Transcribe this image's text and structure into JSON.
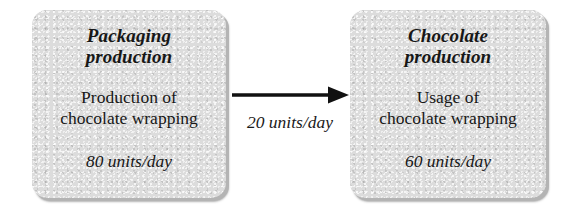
{
  "diagram": {
    "type": "process-flow",
    "title": "",
    "background_color": "#ffffff",
    "node_fill_color": "#dcdcdc",
    "node_shadow_color": "#b4b4b4",
    "connector_color": "#111111",
    "nodes": [
      {
        "id": "packaging-production",
        "title": "Packaging\nproduction",
        "body": "Production of\nchocolate wrapping",
        "rate": "80 units/day"
      },
      {
        "id": "chocolate-production",
        "title": "Chocolate\nproduction",
        "body": "Usage of\nchocolate wrapping",
        "rate": "60 units/day"
      }
    ],
    "connector": {
      "from": "packaging-production",
      "to": "chocolate-production",
      "direction": "right",
      "label": "20 units/day",
      "arrowhead": "filled-triangle"
    }
  }
}
